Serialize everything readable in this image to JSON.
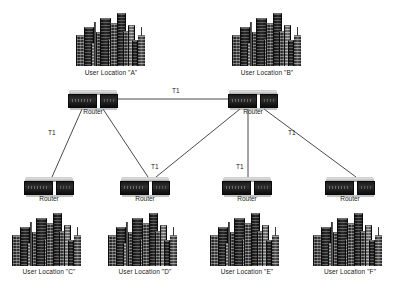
{
  "diagram": {
    "background_color": "#ffffff",
    "line_color": "#4a4a4a",
    "text_color": "#1a1a1a"
  },
  "sites": [
    {
      "id": "A",
      "location_label": "User Location \"A\"",
      "router_label": "Router",
      "city_icon": "city-skyline-icon",
      "router_icon": "router-icon",
      "city_x": 76,
      "city_y": 12,
      "router_x": 68,
      "router_y": 90,
      "city_caption_x": 50,
      "city_caption_y": 69,
      "router_caption_x": 68,
      "router_caption_y": 108
    },
    {
      "id": "B",
      "location_label": "User Location \"B\"",
      "router_label": "Router",
      "city_icon": "city-skyline-icon",
      "router_icon": "router-icon",
      "city_x": 232,
      "city_y": 12,
      "router_x": 228,
      "router_y": 90,
      "city_caption_x": 206,
      "city_caption_y": 69,
      "router_caption_x": 228,
      "router_caption_y": 108
    },
    {
      "id": "C",
      "location_label": "User Location \"C\"",
      "router_label": "Router",
      "city_icon": "city-skyline-icon",
      "router_icon": "router-icon",
      "city_x": 12,
      "city_y": 212,
      "router_x": 24,
      "router_y": 177,
      "city_caption_x": -12,
      "city_caption_y": 268,
      "router_caption_x": 24,
      "router_caption_y": 195
    },
    {
      "id": "D",
      "location_label": "User Location \"D\"",
      "router_label": "Router",
      "city_icon": "city-skyline-icon",
      "router_icon": "router-icon",
      "city_x": 108,
      "city_y": 212,
      "router_x": 120,
      "router_y": 177,
      "city_caption_x": 84,
      "city_caption_y": 268,
      "router_caption_x": 120,
      "router_caption_y": 195
    },
    {
      "id": "E",
      "location_label": "User Location \"E\"",
      "router_label": "Router",
      "city_icon": "city-skyline-icon",
      "router_icon": "router-icon",
      "city_x": 210,
      "city_y": 212,
      "router_x": 222,
      "router_y": 177,
      "city_caption_x": 186,
      "city_caption_y": 268,
      "router_caption_x": 222,
      "router_caption_y": 195
    },
    {
      "id": "F",
      "location_label": "User Location \"F\"",
      "router_label": "Router",
      "city_icon": "city-skyline-icon",
      "router_icon": "router-icon",
      "city_x": 313,
      "city_y": 212,
      "router_x": 325,
      "router_y": 177,
      "city_caption_x": 289,
      "city_caption_y": 268,
      "router_caption_x": 325,
      "router_caption_y": 195
    }
  ],
  "links": [
    {
      "id": "a-b",
      "from": "A",
      "to": "B",
      "label": "T1",
      "x1": 118,
      "y1": 99,
      "x2": 228,
      "y2": 99,
      "label_x": 172,
      "label_y": 87
    },
    {
      "id": "a-c",
      "from": "A",
      "to": "C",
      "label": "T1",
      "x1": 82,
      "y1": 109,
      "x2": 52,
      "y2": 177,
      "label_x": 48,
      "label_y": 129
    },
    {
      "id": "a-d",
      "from": "A",
      "to": "D",
      "label": "",
      "x1": 103,
      "y1": 109,
      "x2": 148,
      "y2": 177,
      "label_x": 0,
      "label_y": 0
    },
    {
      "id": "b-d",
      "from": "B",
      "to": "D",
      "label": "T1",
      "x1": 240,
      "y1": 109,
      "x2": 156,
      "y2": 177,
      "label_x": 151,
      "label_y": 163
    },
    {
      "id": "b-e",
      "from": "B",
      "to": "E",
      "label": "T1",
      "x1": 248,
      "y1": 109,
      "x2": 248,
      "y2": 177,
      "label_x": 236,
      "label_y": 163
    },
    {
      "id": "b-f",
      "from": "B",
      "to": "F",
      "label": "T1",
      "x1": 264,
      "y1": 109,
      "x2": 356,
      "y2": 177,
      "label_x": 288,
      "label_y": 129
    }
  ]
}
